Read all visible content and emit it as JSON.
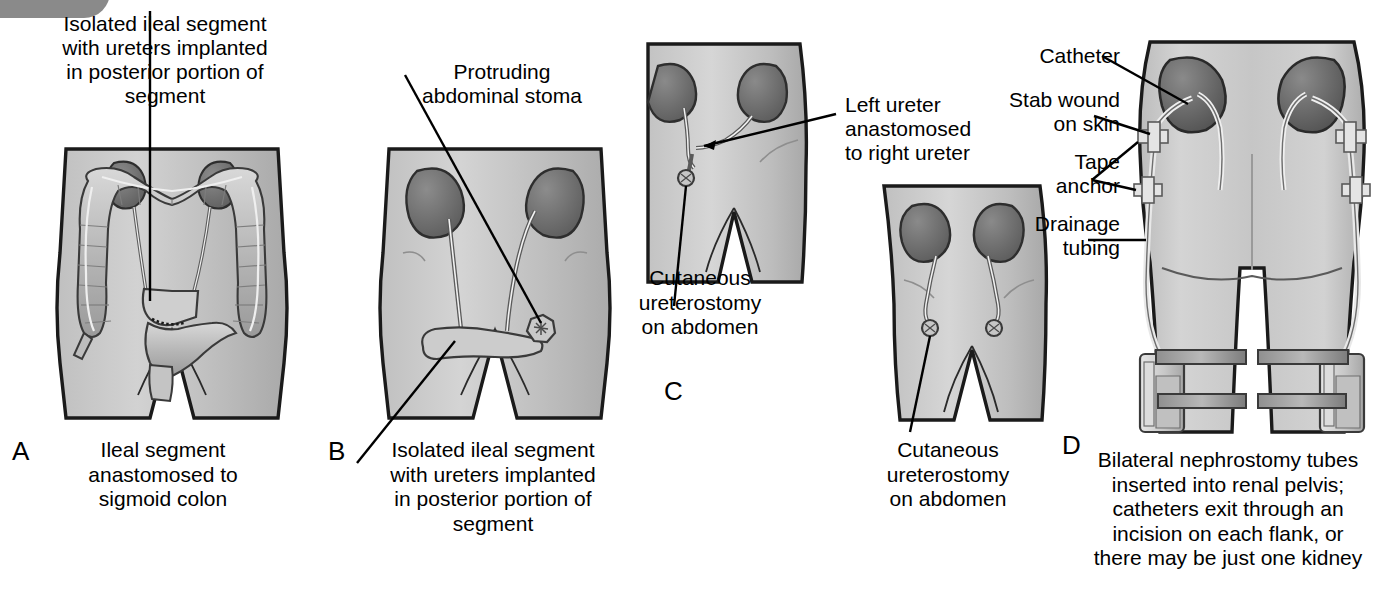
{
  "figure": {
    "type": "medical-illustration",
    "background": "#ffffff",
    "skin_fill": "#c8c8c8",
    "kidney_fill": "#6e6e6e",
    "outline": "#1a1a1a"
  },
  "panels": [
    {
      "id": "A",
      "letter": "A",
      "top_label": "Isolated ileal segment\nwith ureters implanted\nin posterior portion of\nsegment",
      "caption": "Ileal segment\nanastomosed to\nsigmoid colon",
      "anatomy": [
        "kidney-left",
        "kidney-right",
        "ascending-colon",
        "transverse-colon",
        "descending-colon",
        "sigmoid-colon",
        "ileal-segment",
        "ureters",
        "rectum",
        "appendix"
      ]
    },
    {
      "id": "B",
      "letter": "B",
      "top_label": "Protruding\nabdominal stoma",
      "caption": "Isolated ileal segment\nwith ureters implanted\nin posterior portion of\nsegment",
      "anatomy": [
        "kidney-left",
        "kidney-right",
        "ureters",
        "ileal-conduit",
        "abdominal-stoma"
      ]
    },
    {
      "id": "C",
      "letter": "C",
      "labels": [
        "Left ureter\nanastomosed\nto right ureter",
        "Cutaneous\nureterostomy\non abdomen",
        "Cutaneous\nureterostomy\non abdomen"
      ],
      "anatomy": [
        "kidney-left",
        "kidney-right",
        "ureters",
        "transureteroureterostomy",
        "cutaneous-stoma"
      ]
    },
    {
      "id": "D",
      "letter": "D",
      "labels": [
        "Catheter",
        "Stab wound\non skin",
        "Tape\nanchor",
        "Drainage\ntubing"
      ],
      "caption": "Bilateral nephrostomy tubes\ninserted into renal pelvis;\ncatheters exit through an\nincision on each flank, or\nthere may be just one kidney",
      "anatomy": [
        "kidney-left",
        "kidney-right",
        "nephrostomy-tube",
        "tape-anchor",
        "drainage-tubing",
        "leg-drainage-bag",
        "leg-strap"
      ]
    }
  ],
  "labels": {
    "a_top": "Isolated ileal segment\nwith ureters implanted\nin posterior portion of\nsegment",
    "a_caption": "Ileal segment\nanastomosed to\nsigmoid colon",
    "a_letter": "A",
    "b_top": "Protruding\nabdominal stoma",
    "b_caption": "Isolated ileal segment\nwith ureters implanted\nin posterior portion of\nsegment",
    "b_letter": "B",
    "c_left_ureter": "Left ureter\nanastomosed\nto right ureter",
    "c_cutaneous_upper": "Cutaneous\nureterostomy\non abdomen",
    "c_cutaneous_lower": "Cutaneous\nureterostomy\non abdomen",
    "c_letter": "C",
    "d_catheter": "Catheter",
    "d_stab_wound": "Stab wound\non skin",
    "d_tape_anchor": "Tape\nanchor",
    "d_drainage_tubing": "Drainage\ntubing",
    "d_caption": "Bilateral nephrostomy tubes\ninserted into renal pelvis;\ncatheters exit through an\nincision on each flank, or\nthere may be just one kidney",
    "d_letter": "D"
  }
}
